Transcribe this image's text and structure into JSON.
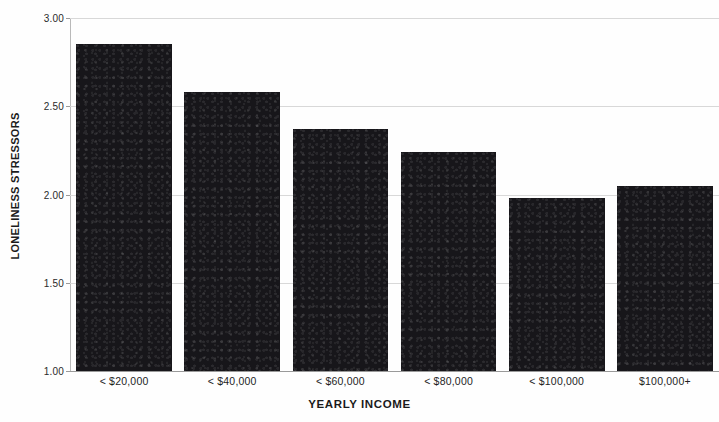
{
  "chart_data": {
    "type": "bar",
    "title": "",
    "xlabel": "YEARLY INCOME",
    "ylabel": "LONELINESS STRESSORS",
    "categories": [
      "< $20,000",
      "< $40,000",
      "< $60,000",
      "< $80,000",
      "< $100,000",
      "$100,000+"
    ],
    "values": [
      2.85,
      2.58,
      2.37,
      2.24,
      1.98,
      2.05
    ],
    "series": [
      {
        "name": "Loneliness stressors",
        "values": [
          2.85,
          2.58,
          2.37,
          2.24,
          1.98,
          2.05
        ]
      }
    ],
    "ylim": [
      1.0,
      3.0
    ],
    "yticks": [
      1.0,
      1.5,
      2.0,
      2.5,
      3.0
    ],
    "ytick_labels": [
      "1.00",
      "1.50",
      "2.00",
      "2.50",
      "3.00"
    ],
    "grid": true,
    "legend": false,
    "legend_position": "none",
    "bar_color": "#17161a",
    "grid_color": "#d8d8d8",
    "axis_color": "#9a9a9a",
    "background_color": "#fefefe"
  }
}
